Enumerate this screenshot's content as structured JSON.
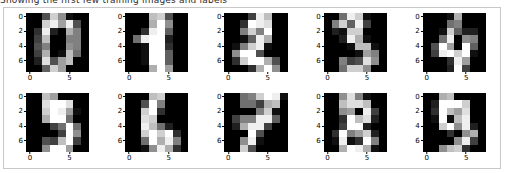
{
  "figure": {
    "top_text_remnant": "Showing the first few training images and labels",
    "background_color": "#ffffff",
    "frame_color": "#c8c8c8",
    "colormap": "gray",
    "rows": 2,
    "cols": 5
  },
  "axes": {
    "xticks": [
      0,
      5
    ],
    "yticks": [
      0,
      2,
      4,
      6
    ],
    "xtick_labels": [
      "0",
      "5"
    ],
    "ytick_labels": [
      "0",
      "2",
      "4",
      "6"
    ],
    "xlim": [
      -0.5,
      7.5
    ],
    "ylim": [
      7.5,
      -0.5
    ],
    "grid": false
  },
  "chart_data": {
    "type": "heatmap",
    "title": "Showing the first few training images and labels",
    "xlabel": "",
    "ylabel": "",
    "colormap": "gray",
    "vmin": 0,
    "vmax": 16,
    "cell_shape": [
      8,
      8
    ],
    "panels": [
      {
        "label": "0",
        "row": 0,
        "col": 0,
        "pixels": [
          [
            0,
            0,
            5,
            13,
            9,
            1,
            0,
            0
          ],
          [
            0,
            0,
            13,
            15,
            10,
            15,
            5,
            0
          ],
          [
            0,
            3,
            15,
            2,
            0,
            11,
            8,
            0
          ],
          [
            0,
            4,
            12,
            0,
            0,
            8,
            8,
            0
          ],
          [
            0,
            5,
            8,
            0,
            0,
            9,
            8,
            0
          ],
          [
            0,
            4,
            11,
            0,
            1,
            12,
            7,
            0
          ],
          [
            0,
            2,
            14,
            5,
            10,
            12,
            0,
            0
          ],
          [
            0,
            0,
            6,
            13,
            10,
            0,
            0,
            0
          ]
        ]
      },
      {
        "label": "1",
        "row": 0,
        "col": 1,
        "pixels": [
          [
            0,
            0,
            0,
            12,
            13,
            5,
            0,
            0
          ],
          [
            0,
            0,
            0,
            11,
            16,
            9,
            0,
            0
          ],
          [
            0,
            0,
            3,
            15,
            16,
            6,
            0,
            0
          ],
          [
            0,
            7,
            15,
            16,
            16,
            2,
            0,
            0
          ],
          [
            0,
            0,
            1,
            16,
            16,
            3,
            0,
            0
          ],
          [
            0,
            0,
            1,
            16,
            16,
            6,
            0,
            0
          ],
          [
            0,
            0,
            1,
            16,
            16,
            6,
            0,
            0
          ],
          [
            0,
            0,
            0,
            11,
            16,
            10,
            0,
            0
          ]
        ]
      },
      {
        "label": "2",
        "row": 0,
        "col": 2,
        "pixels": [
          [
            0,
            0,
            0,
            4,
            15,
            12,
            0,
            0
          ],
          [
            0,
            0,
            3,
            16,
            15,
            14,
            0,
            0
          ],
          [
            0,
            0,
            8,
            13,
            8,
            16,
            0,
            0
          ],
          [
            0,
            0,
            1,
            6,
            15,
            11,
            0,
            0
          ],
          [
            0,
            1,
            8,
            13,
            15,
            1,
            0,
            0
          ],
          [
            0,
            9,
            16,
            16,
            5,
            0,
            0,
            0
          ],
          [
            0,
            3,
            13,
            16,
            16,
            11,
            5,
            0
          ],
          [
            0,
            0,
            0,
            3,
            11,
            16,
            9,
            0
          ]
        ]
      },
      {
        "label": "3",
        "row": 0,
        "col": 3,
        "pixels": [
          [
            0,
            0,
            7,
            15,
            13,
            1,
            0,
            0
          ],
          [
            0,
            8,
            13,
            6,
            15,
            4,
            0,
            0
          ],
          [
            0,
            2,
            1,
            13,
            13,
            0,
            0,
            0
          ],
          [
            0,
            0,
            2,
            15,
            11,
            1,
            0,
            0
          ],
          [
            0,
            0,
            0,
            1,
            12,
            12,
            1,
            0
          ],
          [
            0,
            0,
            0,
            0,
            1,
            10,
            8,
            0
          ],
          [
            0,
            0,
            8,
            4,
            5,
            14,
            9,
            0
          ],
          [
            0,
            0,
            7,
            13,
            13,
            9,
            0,
            0
          ]
        ]
      },
      {
        "label": "4",
        "row": 0,
        "col": 4,
        "pixels": [
          [
            0,
            0,
            0,
            1,
            11,
            0,
            0,
            0
          ],
          [
            0,
            0,
            0,
            7,
            8,
            0,
            0,
            0
          ],
          [
            0,
            0,
            1,
            13,
            6,
            2,
            2,
            0
          ],
          [
            0,
            0,
            7,
            15,
            0,
            9,
            8,
            0
          ],
          [
            0,
            5,
            16,
            10,
            0,
            16,
            6,
            0
          ],
          [
            0,
            4,
            15,
            16,
            13,
            16,
            1,
            0
          ],
          [
            0,
            0,
            0,
            3,
            15,
            10,
            0,
            0
          ],
          [
            0,
            0,
            0,
            2,
            16,
            4,
            0,
            0
          ]
        ]
      },
      {
        "label": "5",
        "row": 1,
        "col": 0,
        "pixels": [
          [
            0,
            0,
            12,
            10,
            0,
            0,
            0,
            0
          ],
          [
            0,
            0,
            14,
            16,
            16,
            14,
            0,
            0
          ],
          [
            0,
            0,
            13,
            16,
            15,
            10,
            1,
            0
          ],
          [
            0,
            0,
            11,
            16,
            16,
            7,
            0,
            0
          ],
          [
            0,
            0,
            0,
            4,
            7,
            16,
            7,
            0
          ],
          [
            0,
            0,
            0,
            0,
            4,
            16,
            9,
            0
          ],
          [
            0,
            0,
            5,
            4,
            12,
            16,
            4,
            0
          ],
          [
            0,
            0,
            9,
            16,
            16,
            10,
            0,
            0
          ]
        ]
      },
      {
        "label": "6",
        "row": 1,
        "col": 1,
        "pixels": [
          [
            0,
            0,
            0,
            12,
            13,
            0,
            0,
            0
          ],
          [
            0,
            0,
            5,
            16,
            8,
            0,
            0,
            0
          ],
          [
            0,
            0,
            13,
            16,
            3,
            0,
            0,
            0
          ],
          [
            0,
            0,
            14,
            13,
            0,
            0,
            0,
            0
          ],
          [
            0,
            0,
            15,
            12,
            7,
            2,
            0,
            0
          ],
          [
            0,
            0,
            13,
            16,
            13,
            16,
            3,
            0
          ],
          [
            0,
            0,
            7,
            16,
            11,
            15,
            8,
            0
          ],
          [
            0,
            0,
            1,
            9,
            15,
            11,
            3,
            0
          ]
        ]
      },
      {
        "label": "7",
        "row": 1,
        "col": 2,
        "pixels": [
          [
            0,
            0,
            7,
            8,
            13,
            16,
            15,
            1
          ],
          [
            0,
            0,
            7,
            7,
            4,
            11,
            12,
            0
          ],
          [
            0,
            0,
            0,
            0,
            8,
            13,
            1,
            0
          ],
          [
            0,
            4,
            8,
            8,
            15,
            15,
            6,
            0
          ],
          [
            0,
            2,
            11,
            15,
            15,
            4,
            0,
            0
          ],
          [
            0,
            0,
            0,
            16,
            5,
            0,
            0,
            0
          ],
          [
            0,
            0,
            9,
            15,
            1,
            0,
            0,
            0
          ],
          [
            0,
            0,
            13,
            5,
            0,
            0,
            0,
            0
          ]
        ]
      },
      {
        "label": "8",
        "row": 1,
        "col": 3,
        "pixels": [
          [
            0,
            0,
            9,
            14,
            8,
            1,
            0,
            0
          ],
          [
            0,
            0,
            12,
            14,
            14,
            12,
            0,
            0
          ],
          [
            0,
            0,
            9,
            10,
            0,
            15,
            4,
            0
          ],
          [
            0,
            0,
            3,
            16,
            12,
            14,
            2,
            0
          ],
          [
            0,
            0,
            4,
            16,
            16,
            2,
            0,
            0
          ],
          [
            0,
            3,
            16,
            8,
            10,
            13,
            2,
            0
          ],
          [
            0,
            1,
            15,
            1,
            3,
            16,
            8,
            0
          ],
          [
            0,
            0,
            11,
            16,
            15,
            11,
            1,
            0
          ]
        ]
      },
      {
        "label": "9",
        "row": 1,
        "col": 4,
        "pixels": [
          [
            0,
            0,
            11,
            12,
            0,
            0,
            0,
            0
          ],
          [
            0,
            2,
            16,
            16,
            16,
            13,
            0,
            0
          ],
          [
            0,
            3,
            16,
            12,
            10,
            14,
            0,
            0
          ],
          [
            0,
            1,
            16,
            1,
            12,
            15,
            0,
            0
          ],
          [
            0,
            0,
            13,
            16,
            9,
            15,
            2,
            0
          ],
          [
            0,
            0,
            0,
            3,
            0,
            9,
            11,
            0
          ],
          [
            0,
            0,
            0,
            0,
            9,
            15,
            4,
            0
          ],
          [
            0,
            0,
            9,
            12,
            13,
            3,
            0,
            0
          ]
        ]
      }
    ]
  }
}
